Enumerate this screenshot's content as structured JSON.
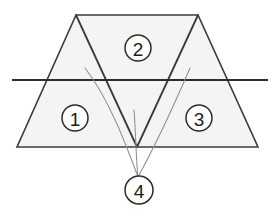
{
  "figure": {
    "canvas": {
      "width": 275,
      "height": 218
    },
    "colors": {
      "background": "#ffffff",
      "fill": "#f4f4f2",
      "outline": "#3a3a3a",
      "inner_line": "#3a3a3a",
      "section_line": "#2e2e2e",
      "leader_line": "#8e8e8e",
      "callout_stroke": "#2b2b2b",
      "callout_fill": "#ffffff",
      "label_text": "#1c1c1c"
    },
    "outer_shape": {
      "name": "trapezoid",
      "points": "76,15 198,15 258,147 17,147"
    },
    "inner_shapes": [
      {
        "name": "left-inner-triangle",
        "points": "76,15 137,147 17,147"
      },
      {
        "name": "right-inner-triangle",
        "points": "198,15 258,147 137,147"
      }
    ],
    "inner_lines": [
      {
        "name": "left-inner-edge",
        "x1": 76,
        "y1": 15,
        "x2": 137,
        "y2": 147
      },
      {
        "name": "right-inner-edge",
        "x1": 198,
        "y1": 15,
        "x2": 137,
        "y2": 147
      }
    ],
    "section_line": {
      "x1": 12,
      "y1": 80,
      "x2": 268,
      "y2": 80
    },
    "leader_lines": [
      {
        "name": "leader-to-region-1",
        "path": "M 85,68 C 110,100 128,150 138,177"
      },
      {
        "name": "leader-to-region-middle",
        "path": "M 134,110 C 136,135 136,160 138,177"
      },
      {
        "name": "leader-to-region-3",
        "path": "M 190,68 C 172,110 150,155 138,177"
      }
    ],
    "callouts": [
      {
        "name": "callout-1",
        "label": "1",
        "cx": 75,
        "cy": 118,
        "r": 13
      },
      {
        "name": "callout-2",
        "label": "2",
        "cx": 138,
        "cy": 48,
        "r": 13
      },
      {
        "name": "callout-3",
        "label": "3",
        "cx": 199,
        "cy": 118,
        "r": 13
      },
      {
        "name": "callout-4",
        "label": "4",
        "cx": 139,
        "cy": 190,
        "r": 14
      }
    ]
  }
}
